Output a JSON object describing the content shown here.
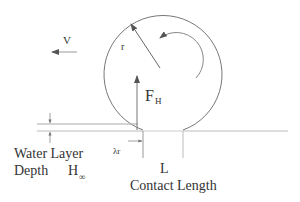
{
  "diagram": {
    "labels": {
      "velocity": "V",
      "radius": "r",
      "force_main": "F",
      "force_sub": "H",
      "lambda_r": "λr",
      "contact_symbol": "L",
      "contact_length": "Contact Length",
      "water_layer": "Water Layer",
      "depth": "Depth",
      "depth_symbol": "H",
      "depth_sub": "∞"
    },
    "colors": {
      "stroke": "#777777",
      "light_stroke": "#bbbbbb",
      "text": "#333333"
    }
  }
}
